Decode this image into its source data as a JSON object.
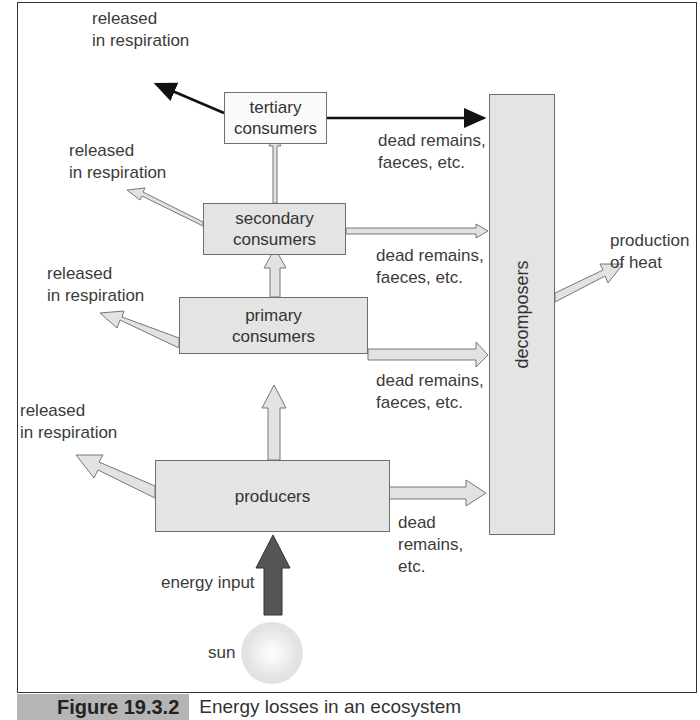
{
  "diagram": {
    "title": "Energy losses in an ecosystem",
    "nodes": {
      "tertiary": "tertiary\nconsumers",
      "secondary": "secondary\nconsumers",
      "primary": "primary\nconsumers",
      "producers": "producers",
      "decomposers": "decomposers",
      "sun": "sun"
    },
    "labels": {
      "resp_tertiary_1": "released",
      "resp_tertiary_2": "in respiration",
      "resp_secondary_1": "released",
      "resp_secondary_2": "in respiration",
      "resp_primary_1": "released",
      "resp_primary_2": "in respiration",
      "resp_producers_1": "released",
      "resp_producers_2": "in respiration",
      "dead_tertiary_1": "dead remains,",
      "dead_tertiary_2": "faeces, etc.",
      "dead_secondary_1": "dead remains,",
      "dead_secondary_2": "faeces, etc.",
      "dead_primary_1": "dead remains,",
      "dead_primary_2": "faeces, etc.",
      "dead_producers_1": "dead",
      "dead_producers_2": "remains,",
      "dead_producers_3": "etc.",
      "heat_1": "production",
      "heat_2": "of heat",
      "energy_input": "energy input"
    },
    "node_labels": {
      "tertiary_1": "tertiary",
      "tertiary_2": "consumers",
      "secondary_1": "secondary",
      "secondary_2": "consumers",
      "primary_1": "primary",
      "primary_2": "consumers",
      "producers": "producers",
      "decomposers": "decomposers"
    }
  },
  "caption": {
    "figure_number": "Figure 19.3.2",
    "text": "Energy losses in an ecosystem"
  },
  "colors": {
    "box_fill": "#e4e4e4",
    "arrow_fill": "#e2e2e2",
    "energy_arrow": "#555555",
    "caption_tab": "#b5b5b5"
  }
}
